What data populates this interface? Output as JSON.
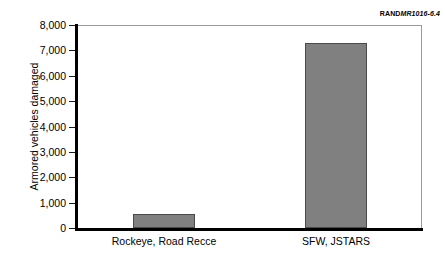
{
  "credit": {
    "brand": "RAND",
    "document": "MR1016-6.4"
  },
  "chart_data": {
    "type": "bar",
    "title": "",
    "xlabel": "",
    "ylabel": "Armored vehicles damaged",
    "categories": [
      "Rockeye, Road Recce",
      "SFW, JSTARS"
    ],
    "values": [
      550,
      7300
    ],
    "ylim": [
      0,
      8000
    ],
    "ytick_values": [
      0,
      1000,
      2000,
      3000,
      4000,
      5000,
      6000,
      7000,
      8000
    ],
    "ytick_labels": [
      "0",
      "1,000",
      "2,000",
      "3,000",
      "4,000",
      "5,000",
      "6,000",
      "7,000",
      "8,000"
    ],
    "grid": false,
    "legend": null,
    "bar_color": "#808080",
    "bar_edge_color": "#4a4a4a",
    "axis_color": "#000000"
  }
}
